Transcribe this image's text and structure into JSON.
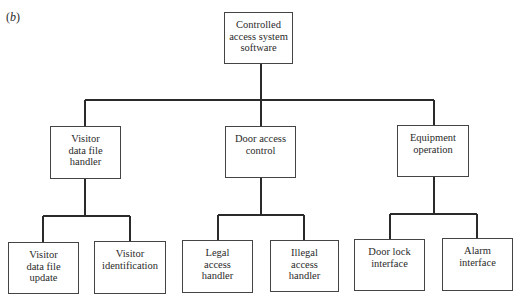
{
  "figure": {
    "label_open": "(",
    "label_letter": "b",
    "label_close": ")"
  },
  "nodes": {
    "root": {
      "text": "Controlled\naccess system\nsoftware"
    },
    "visitor_handler": {
      "text": "Visitor\ndata file\nhandler"
    },
    "door_access": {
      "text": "Door access\ncontrol"
    },
    "equipment": {
      "text": "Equipment\noperation"
    },
    "visitor_update": {
      "text": "Visitor\ndata file\nupdate"
    },
    "visitor_id": {
      "text": "Visitor\nidentification"
    },
    "legal": {
      "text": "Legal\naccess\nhandler"
    },
    "illegal": {
      "text": "Illegal\naccess\nhandler"
    },
    "door_lock": {
      "text": "Door lock\ninterface"
    },
    "alarm": {
      "text": "Alarm\ninterface"
    }
  },
  "style": {
    "line_color": "#2a2a2a",
    "box_border": "#444444"
  }
}
